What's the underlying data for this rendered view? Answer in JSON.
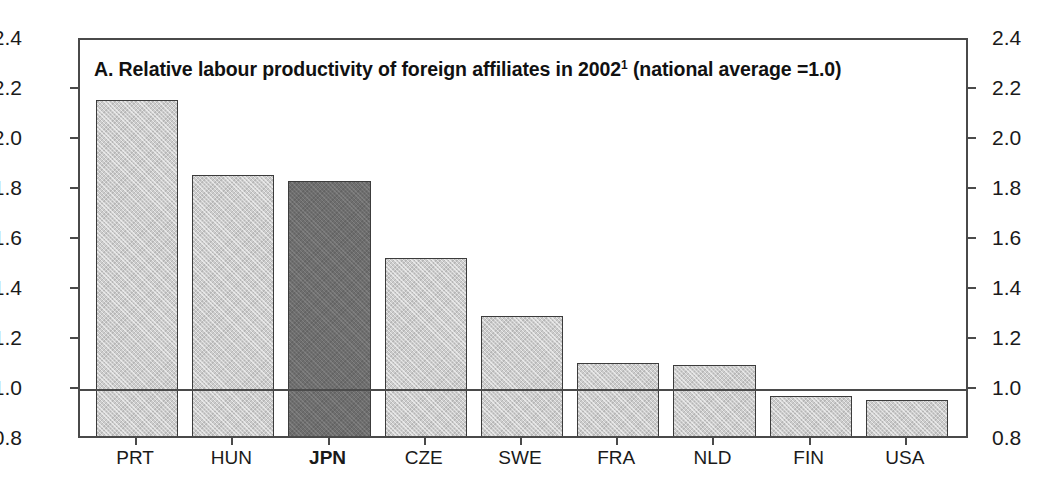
{
  "chart_data": {
    "type": "bar",
    "title_main": "A. Relative labour productivity of foreign affiliates in 2002",
    "title_footnote_marker": "1",
    "title_tail": " (national average =1.0)",
    "xlabel": "",
    "ylabel": "",
    "ylim": [
      0.8,
      2.4
    ],
    "ytick_labels": [
      "2.4",
      "2.2",
      "2.0",
      "1.8",
      "1.6",
      "1.4",
      "1.2",
      "1.0",
      "0.8"
    ],
    "ytick_values": [
      2.4,
      2.2,
      2.0,
      1.8,
      1.6,
      1.4,
      1.2,
      1.0,
      0.8
    ],
    "right_axis_labels": [
      "2.4",
      "2.2",
      "2.0",
      "1.8",
      "1.6",
      "1.4",
      "1.2",
      "1.0",
      "0.8"
    ],
    "grid": false,
    "legend": "none",
    "reference_line": 1.0,
    "categories": [
      "PRT",
      "HUN",
      "JPN",
      "CZE",
      "SWE",
      "FRA",
      "NLD",
      "FIN",
      "USA"
    ],
    "values": [
      2.16,
      1.86,
      1.835,
      1.53,
      1.295,
      1.11,
      1.1,
      0.975,
      0.96
    ],
    "highlight_category": "JPN",
    "colors": {
      "bar_default": "#cccccc",
      "bar_highlight": "#6e6e6e",
      "bar_border": "#3c3c3c",
      "axis": "#4a4a4a",
      "text": "#1a1a1a",
      "background": "#ffffff"
    },
    "bars": [
      {
        "label": "PRT",
        "value": 2.16,
        "highlight": false
      },
      {
        "label": "HUN",
        "value": 1.86,
        "highlight": false
      },
      {
        "label": "JPN",
        "value": 1.835,
        "highlight": true
      },
      {
        "label": "CZE",
        "value": 1.53,
        "highlight": false
      },
      {
        "label": "SWE",
        "value": 1.295,
        "highlight": false
      },
      {
        "label": "FRA",
        "value": 1.11,
        "highlight": false
      },
      {
        "label": "NLD",
        "value": 1.1,
        "highlight": false
      },
      {
        "label": "FIN",
        "value": 0.975,
        "highlight": false
      },
      {
        "label": "USA",
        "value": 0.96,
        "highlight": false
      }
    ]
  }
}
